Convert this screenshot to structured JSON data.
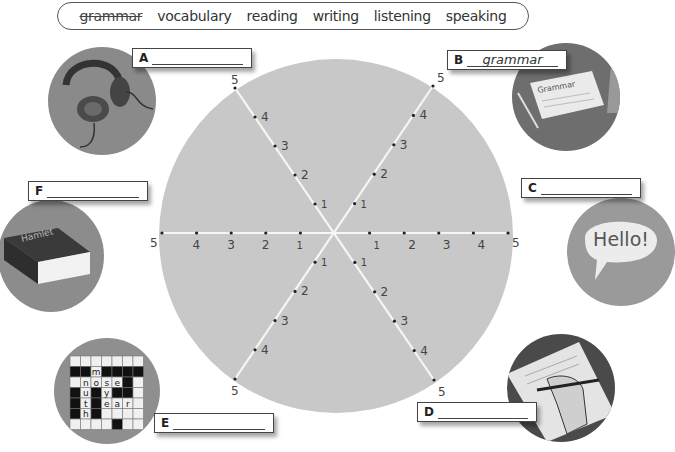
{
  "word_bank": {
    "words": [
      {
        "text": "grammar",
        "struck": true
      },
      {
        "text": "vocabulary",
        "struck": false
      },
      {
        "text": "reading",
        "struck": false
      },
      {
        "text": "writing",
        "struck": false
      },
      {
        "text": "listening",
        "struck": false
      },
      {
        "text": "speaking",
        "struck": false
      }
    ]
  },
  "wheel": {
    "fill_color": "#c8c8c8",
    "axis_color": "#f4f4f4",
    "scale": [
      "1",
      "2",
      "3",
      "4",
      "5"
    ]
  },
  "labels": {
    "A": {
      "letter": "A",
      "answer": "",
      "picture": "headphones"
    },
    "B": {
      "letter": "B",
      "answer": "grammar",
      "picture": "grammar-book"
    },
    "C": {
      "letter": "C",
      "answer": "",
      "picture": "speech-bubble"
    },
    "D": {
      "letter": "D",
      "answer": "",
      "picture": "hand-writing"
    },
    "E": {
      "letter": "E",
      "answer": "",
      "picture": "crossword"
    },
    "F": {
      "letter": "F",
      "answer": "",
      "picture": "hamlet-book"
    }
  },
  "pictures": {
    "book_title": "Grammar",
    "bubble_text": "Hello!",
    "novel_title": "Hamlet",
    "crossword_words": [
      "mouth",
      "nose",
      "eye",
      "ear"
    ]
  }
}
